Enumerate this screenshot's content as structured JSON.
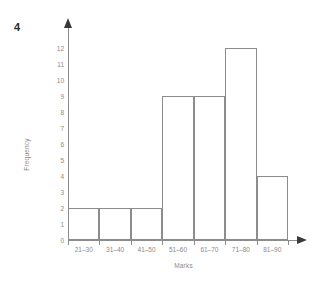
{
  "question_number": "4",
  "chart_data": {
    "type": "bar",
    "title": "",
    "subtitle": "",
    "xlabel": "Marks",
    "ylabel": "Frequency",
    "categories": [
      "21–30",
      "31–40",
      "41–50",
      "51–60",
      "61–70",
      "71–80",
      "81–90"
    ],
    "values": [
      2,
      2,
      2,
      9,
      9,
      12,
      4
    ],
    "ylim": [
      0,
      12
    ],
    "ytick_labels": [
      "12",
      "11",
      "10",
      "9",
      "8",
      "7",
      "6",
      "5",
      "4",
      "3",
      "2",
      "1",
      "0"
    ],
    "ytick_values": [
      12,
      11,
      10,
      9,
      8,
      7,
      6,
      5,
      4,
      3,
      2,
      1,
      0
    ],
    "grid": false,
    "legend": null,
    "bar_fill": "none",
    "bar_border_color": "#8c8c8c",
    "axis_color": "#8c8c8c",
    "tick_label_color": "#8a8a8a",
    "background": "#ffffff"
  }
}
